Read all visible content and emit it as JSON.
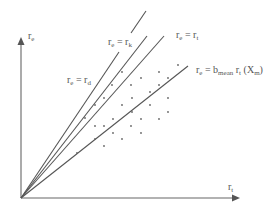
{
  "diagram": {
    "axes": {
      "y_label": {
        "main": "r",
        "sub": "e"
      },
      "x_label": {
        "main": "r",
        "sub": "t"
      }
    },
    "lines": [
      {
        "id": "rd",
        "label": {
          "lhs": "r",
          "lhs_sub": "e",
          "eq": " = ",
          "rhs": "r",
          "rhs_sub": "d"
        }
      },
      {
        "id": "rk",
        "label": {
          "lhs": "r",
          "lhs_sub": "e",
          "eq": " = ",
          "rhs": "r",
          "rhs_sub": "k"
        }
      },
      {
        "id": "rt",
        "label": {
          "lhs": "r",
          "lhs_sub": "e",
          "eq": " = ",
          "rhs": "r",
          "rhs_sub": "t"
        }
      },
      {
        "id": "bmean",
        "label": {
          "lhs": "r",
          "lhs_sub": "e",
          "eq": " = b",
          "b_sub": "mean",
          "mid": " r",
          "mid_sub": "t",
          "tail": " (X",
          "tail_sub": "m",
          "close": ")"
        }
      }
    ],
    "colors": {
      "line": "#555555",
      "axis": "#666666",
      "background": "#ffffff"
    }
  }
}
